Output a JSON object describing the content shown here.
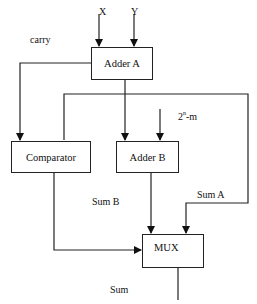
{
  "diagram": {
    "inputs": {
      "x": "X",
      "y": "Y"
    },
    "blocks": {
      "adder_a": "Adder A",
      "comparator": "Comparator",
      "adder_b": "Adder B",
      "mux": "MUX"
    },
    "labels": {
      "carry": "carry",
      "constant_base": "2",
      "constant_exp": "n",
      "constant_rest": "-m",
      "sum_b": "Sum B",
      "sum_a": "Sum A",
      "sum": "Sum"
    },
    "colors": {
      "line": "#222222",
      "background": "#ffffff"
    }
  }
}
